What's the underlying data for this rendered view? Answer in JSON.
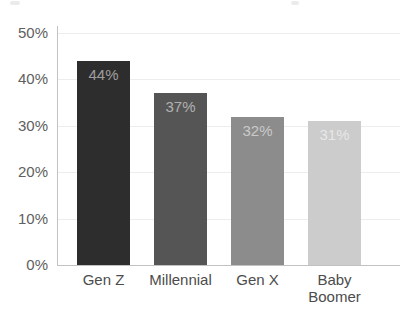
{
  "chart_data": {
    "type": "bar",
    "title": "",
    "xlabel": "",
    "ylabel": "",
    "categories": [
      "Gen Z",
      "Millennial",
      "Gen X",
      "Baby Boomer"
    ],
    "values": [
      44,
      37,
      32,
      31
    ],
    "value_labels": [
      "44%",
      "37%",
      "32%",
      "31%"
    ],
    "bar_colors": [
      "#2d2d2d",
      "#555555",
      "#8c8c8c",
      "#cccccc"
    ],
    "value_label_color": "rgba(255,255,255,0.55)",
    "ylim": [
      0,
      50
    ],
    "y_ticks": [
      0,
      10,
      20,
      30,
      40,
      50
    ],
    "y_tick_labels": [
      "0%",
      "10%",
      "20%",
      "30%",
      "40%",
      "50%"
    ],
    "grid": "horizontal-faint",
    "legend": "none",
    "colors": {
      "axis_text": "#606060",
      "category_text": "#4c4c4c",
      "axis_line": "#c2c2c2",
      "gridline": "#ededed",
      "background": "#ffffff"
    }
  }
}
